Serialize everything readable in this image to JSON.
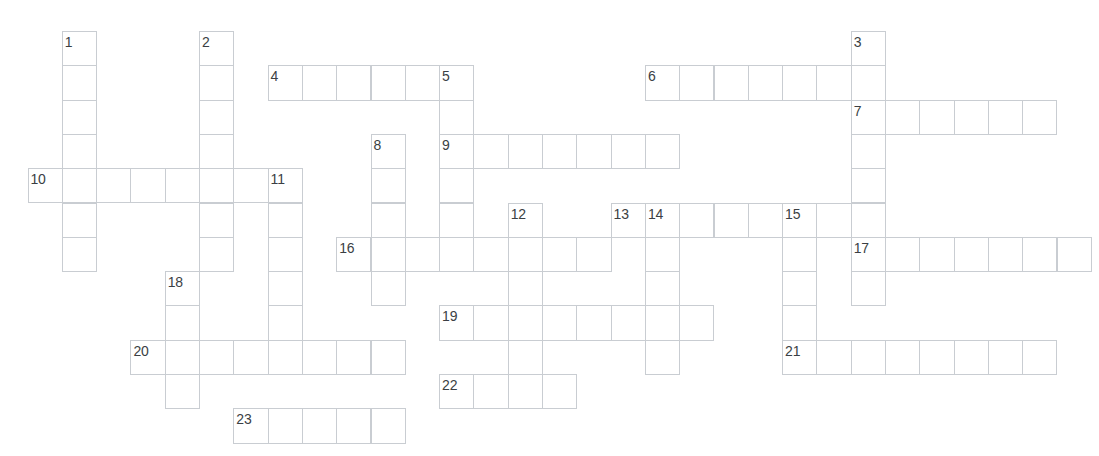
{
  "page": {
    "width": 1099,
    "height": 456,
    "background_color": "#ffffff",
    "grid_line_color": "#c9cdd2",
    "number_color": "#3b3f44",
    "cell_size": 34.3,
    "origin_x": 27.5,
    "origin_y": 31
  },
  "crossword": {
    "clue_numbers": [
      "1",
      "2",
      "3",
      "4",
      "5",
      "6",
      "7",
      "8",
      "9",
      "10",
      "11",
      "12",
      "13",
      "14",
      "15",
      "16",
      "17",
      "18",
      "19",
      "20",
      "21",
      "22",
      "23"
    ],
    "entries": [
      {
        "number": "1",
        "direction": "down",
        "col": 1,
        "row": 0,
        "length": 7
      },
      {
        "number": "2",
        "direction": "down",
        "col": 5,
        "row": 0,
        "length": 7
      },
      {
        "number": "3",
        "direction": "down",
        "col": 24,
        "row": 0,
        "length": 8
      },
      {
        "number": "4",
        "direction": "across",
        "col": 7,
        "row": 1,
        "length": 6
      },
      {
        "number": "5",
        "direction": "down",
        "col": 12,
        "row": 1,
        "length": 6
      },
      {
        "number": "6",
        "direction": "across",
        "col": 18,
        "row": 1,
        "length": 7
      },
      {
        "number": "7",
        "direction": "across",
        "col": 24,
        "row": 2,
        "length": 6
      },
      {
        "number": "8",
        "direction": "down",
        "col": 10,
        "row": 3,
        "length": 5
      },
      {
        "number": "9",
        "direction": "across",
        "col": 12,
        "row": 3,
        "length": 7
      },
      {
        "number": "10",
        "direction": "across",
        "col": 0,
        "row": 4,
        "length": 8
      },
      {
        "number": "11",
        "direction": "down",
        "col": 7,
        "row": 4,
        "length": 6
      },
      {
        "number": "12",
        "direction": "down",
        "col": 14,
        "row": 5,
        "length": 5
      },
      {
        "number": "13",
        "direction": "across",
        "col": 17,
        "row": 5,
        "length": 8
      },
      {
        "number": "14",
        "direction": "down",
        "col": 18,
        "row": 5,
        "length": 5
      },
      {
        "number": "15",
        "direction": "down",
        "col": 22,
        "row": 5,
        "length": 5
      },
      {
        "number": "16",
        "direction": "across",
        "col": 9,
        "row": 6,
        "length": 8
      },
      {
        "number": "17",
        "direction": "across",
        "col": 24,
        "row": 6,
        "length": 7
      },
      {
        "number": "18",
        "direction": "down",
        "col": 4,
        "row": 7,
        "length": 4
      },
      {
        "number": "19",
        "direction": "across",
        "col": 12,
        "row": 8,
        "length": 8
      },
      {
        "number": "20",
        "direction": "across",
        "col": 3,
        "row": 9,
        "length": 8
      },
      {
        "number": "21",
        "direction": "across",
        "col": 22,
        "row": 9,
        "length": 8
      },
      {
        "number": "22",
        "direction": "across",
        "col": 12,
        "row": 10,
        "length": 4
      },
      {
        "number": "23",
        "direction": "across",
        "col": 6,
        "row": 11,
        "length": 5
      }
    ]
  }
}
